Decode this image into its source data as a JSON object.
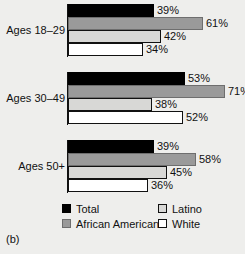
{
  "panel_caption": "(b)",
  "chart_data": {
    "type": "bar",
    "orientation": "horizontal",
    "title": "",
    "xlabel": "",
    "ylabel": "",
    "xlim": [
      0,
      71
    ],
    "grid": false,
    "value_suffix": "%",
    "legend_position": "bottom",
    "categories": [
      "Ages 18–29",
      "Ages 30–49",
      "Ages 50+"
    ],
    "series": [
      {
        "name": "Total",
        "color": "#000000",
        "values": [
          39,
          53,
          39
        ]
      },
      {
        "name": "African American",
        "color": "#9a9a9a",
        "values": [
          61,
          71,
          58
        ]
      },
      {
        "name": "Latino",
        "color": "#d8d8d6",
        "values": [
          42,
          38,
          45
        ]
      },
      {
        "name": "White",
        "color": "#ffffff",
        "values": [
          34,
          52,
          36
        ]
      }
    ],
    "data_labels": [
      [
        "39%",
        "61%",
        "42%",
        "34%"
      ],
      [
        "53%",
        "71%",
        "38%",
        "52%"
      ],
      [
        "39%",
        "58%",
        "45%",
        "36%"
      ]
    ]
  }
}
